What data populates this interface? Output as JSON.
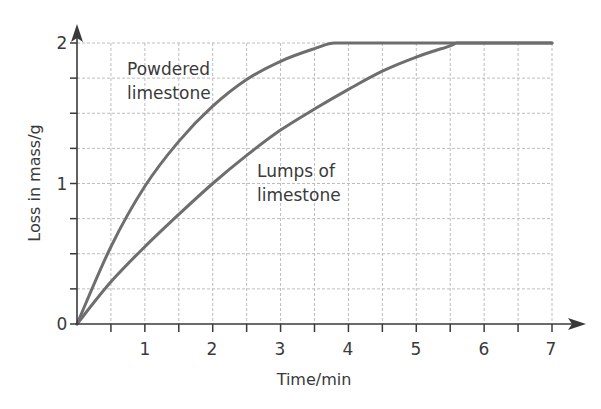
{
  "chart_data": {
    "type": "line",
    "title": "",
    "xlabel": "Time/min",
    "ylabel": "Loss in mass/g",
    "xlim": [
      0,
      7
    ],
    "ylim": [
      0,
      2
    ],
    "x_ticks": [
      0,
      0.5,
      1,
      1.5,
      2,
      2.5,
      3,
      3.5,
      4,
      4.5,
      5,
      5.5,
      6,
      6.5,
      7
    ],
    "x_tick_labels": [
      "1",
      "2",
      "3",
      "4",
      "5",
      "6",
      "7"
    ],
    "y_ticks": [
      0,
      0.25,
      0.5,
      0.75,
      1,
      1.25,
      1.5,
      1.75,
      2
    ],
    "y_tick_labels": [
      "0",
      "1",
      "2"
    ],
    "grid": true,
    "legend": "none (inline annotations)",
    "series": [
      {
        "name": "Powdered limestone",
        "x": [
          0,
          0.5,
          1,
          1.5,
          2,
          2.5,
          3,
          3.5,
          3.8,
          4,
          5,
          6,
          7
        ],
        "values": [
          0,
          0.55,
          0.98,
          1.3,
          1.55,
          1.74,
          1.87,
          1.96,
          2.0,
          2.0,
          2.0,
          2.0,
          2.0
        ]
      },
      {
        "name": "Lumps of limestone",
        "x": [
          0,
          0.5,
          1,
          1.5,
          2,
          2.5,
          3,
          3.5,
          4,
          4.5,
          5,
          5.5,
          5.6,
          6,
          7
        ],
        "values": [
          0,
          0.3,
          0.55,
          0.78,
          1.0,
          1.2,
          1.38,
          1.53,
          1.67,
          1.8,
          1.9,
          1.98,
          2.0,
          2.0,
          2.0
        ]
      }
    ],
    "annotations": [
      {
        "text": [
          "Powdered",
          "limestone"
        ],
        "x": 0.7,
        "y": 1.75
      },
      {
        "text": [
          "Lumps of",
          "limestone"
        ],
        "x": 2.7,
        "y": 0.95
      }
    ]
  },
  "labels": {
    "x_axis_title": "Time/min",
    "y_axis_title": "Loss in mass/g",
    "origin": "0",
    "y_one": "1",
    "y_two": "2",
    "x_ticks": [
      "1",
      "2",
      "3",
      "4",
      "5",
      "6",
      "7"
    ],
    "annotation_powdered_line1": "Powdered",
    "annotation_powdered_line2": "limestone",
    "annotation_lumps_line1": "Lumps of",
    "annotation_lumps_line2": "limestone"
  },
  "colors": {
    "curve": "#6e6e6e",
    "axis": "#3a3a3a",
    "grid": "#bdbdbd",
    "text": "#3a3a3a"
  }
}
